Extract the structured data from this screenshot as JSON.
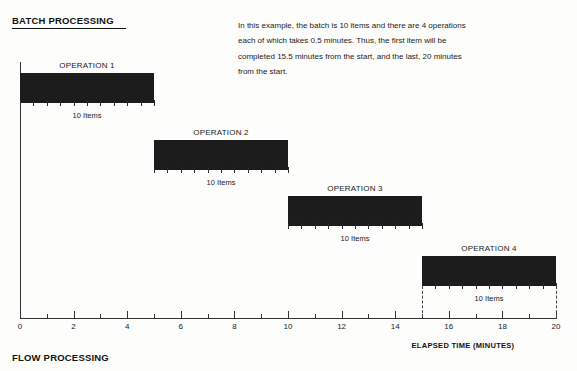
{
  "headings": {
    "batch": "BATCH PROCESSING",
    "flow": "FLOW PROCESSING"
  },
  "caption": {
    "line1": "In this example, the batch is 10 items and there are 4 operations",
    "line2": "each of which takes 0.5 minutes. Thus, the first item will be",
    "line3": "completed 15.5 minutes from the start, and the last, 20 minutes",
    "line4": "from the start."
  },
  "axis": {
    "title": "ELAPSED TIME (MINUTES)",
    "tick_labels": [
      "0",
      "2",
      "4",
      "6",
      "8",
      "10",
      "12",
      "14",
      "16",
      "18",
      "20"
    ],
    "min": 0,
    "max": 20
  },
  "operations": [
    {
      "label": "OPERATION 1",
      "items_label": "10 Items",
      "start": 0,
      "end": 5
    },
    {
      "label": "OPERATION 2",
      "items_label": "10 Items",
      "start": 5,
      "end": 10
    },
    {
      "label": "OPERATION 3",
      "items_label": "10 Items",
      "start": 10,
      "end": 15
    },
    {
      "label": "OPERATION 4",
      "items_label": "10 Items",
      "start": 15,
      "end": 20
    }
  ],
  "colors": {
    "bar": "#1c1c1c",
    "axis": "#333333",
    "text": "#1b1b1b",
    "background": "#fdfdfb"
  },
  "chart_data": {
    "type": "bar",
    "title": "BATCH PROCESSING",
    "subtitle": "In this example, the batch is 10 items and there are 4 operations each of which takes 0.5 minutes. Thus, the first item will be completed 15.5 minutes from the start, and the last, 20 minutes from the start.",
    "xlabel": "ELAPSED TIME (MINUTES)",
    "ylabel": "",
    "xlim": [
      0,
      20
    ],
    "xticks": [
      0,
      2,
      4,
      6,
      8,
      10,
      12,
      14,
      16,
      18,
      20
    ],
    "grid": false,
    "legend": "none",
    "orientation": "horizontal",
    "categories": [
      "OPERATION 1",
      "OPERATION 2",
      "OPERATION 3",
      "OPERATION 4"
    ],
    "series": [
      {
        "name": "Batch duration (minutes)",
        "start": [
          0,
          5,
          10,
          15
        ],
        "end": [
          5,
          10,
          15,
          20
        ],
        "values": [
          5,
          5,
          5,
          5
        ]
      }
    ],
    "items_per_batch": 10,
    "minutes_per_item": 0.5,
    "annotations": [
      {
        "text": "10 Items",
        "x": 2.5,
        "series_index": 0
      },
      {
        "text": "10 Items",
        "x": 7.5,
        "series_index": 1
      },
      {
        "text": "10 Items",
        "x": 12.5,
        "series_index": 2
      },
      {
        "text": "10 Items",
        "x": 17.5,
        "series_index": 3
      }
    ],
    "drop_lines": [
      15,
      20
    ]
  }
}
